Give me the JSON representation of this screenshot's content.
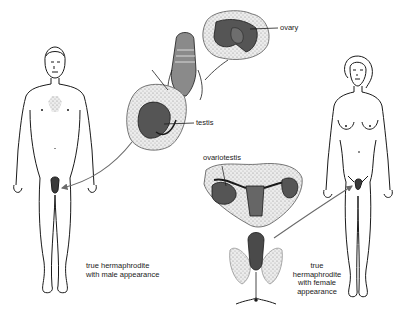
{
  "diagram": {
    "type": "medical-illustration",
    "figures": [
      {
        "id": "male-figure",
        "caption_lines": [
          "true hermaphrodite",
          "with male appearance"
        ]
      },
      {
        "id": "female-figure",
        "caption_lines": [
          "true",
          "hermaphrodite",
          "with female",
          "appearance"
        ]
      }
    ],
    "callouts": {
      "ovary": "ovary",
      "testis": "testis",
      "ovariotestis": "ovariotestis"
    },
    "colors": {
      "line": "#1a1a1a",
      "tissue_fill": "#d9d9d9",
      "organ_fill": "#555555",
      "arrow": "#6a6a6a",
      "background": "#ffffff"
    }
  }
}
